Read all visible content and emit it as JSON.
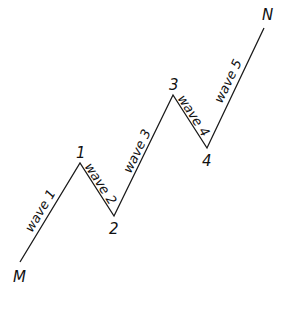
{
  "diagram": {
    "type": "elliott-wave",
    "line_color": "#1a1a1a",
    "points": [
      {
        "id": "M",
        "label": "M",
        "x": 20,
        "y": 262,
        "lx": 13,
        "ly": 282
      },
      {
        "id": "1",
        "label": "1",
        "x": 80,
        "y": 163,
        "lx": 76,
        "ly": 158
      },
      {
        "id": "2",
        "label": "2",
        "x": 114,
        "y": 216,
        "lx": 109,
        "ly": 234
      },
      {
        "id": "3",
        "label": "3",
        "x": 173,
        "y": 95,
        "lx": 169,
        "ly": 90
      },
      {
        "id": "4",
        "label": "4",
        "x": 207,
        "y": 148,
        "lx": 202,
        "ly": 166
      },
      {
        "id": "N",
        "label": "N",
        "x": 264,
        "y": 28,
        "lx": 262,
        "ly": 20
      }
    ],
    "waves": [
      {
        "label": "wave 1",
        "x": 44,
        "y": 213,
        "angle": -59
      },
      {
        "label": "wave 2",
        "x": 97,
        "y": 186,
        "angle": 57
      },
      {
        "label": "wave 3",
        "x": 141,
        "y": 153,
        "angle": -64
      },
      {
        "label": "wave 4",
        "x": 190,
        "y": 118,
        "angle": 57
      },
      {
        "label": "wave 5",
        "x": 232,
        "y": 83,
        "angle": -64
      }
    ]
  }
}
